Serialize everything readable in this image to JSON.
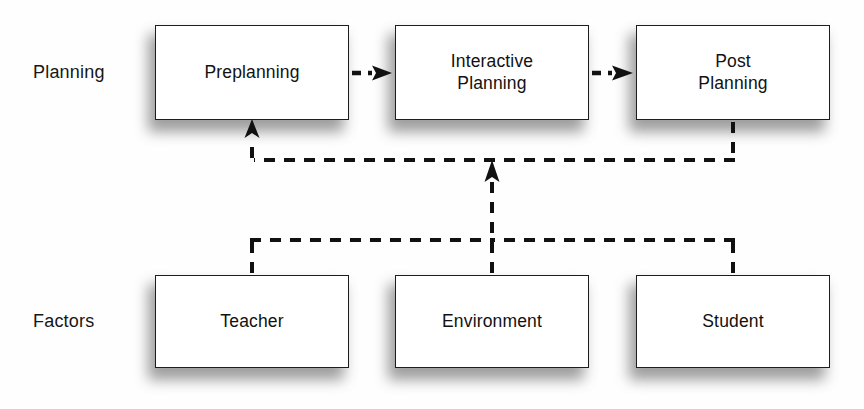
{
  "diagram": {
    "rows": [
      {
        "id": "planning",
        "label": "Planning"
      },
      {
        "id": "factors",
        "label": "Factors"
      }
    ],
    "nodes": [
      {
        "id": "preplanning",
        "label": "Preplanning",
        "row": "planning"
      },
      {
        "id": "interactive-planning",
        "label": "Interactive\nPlanning",
        "row": "planning"
      },
      {
        "id": "post-planning",
        "label": "Post\nPlanning",
        "row": "planning"
      },
      {
        "id": "teacher",
        "label": "Teacher",
        "row": "factors"
      },
      {
        "id": "environment",
        "label": "Environment",
        "row": "factors"
      },
      {
        "id": "student",
        "label": "Student",
        "row": "factors"
      }
    ],
    "connections": [
      {
        "id": "preplanning-to-interactive",
        "from": "preplanning",
        "to": "interactive-planning",
        "style": "dashed-arrow",
        "direction": "right"
      },
      {
        "id": "interactive-to-post",
        "from": "interactive-planning",
        "to": "post-planning",
        "style": "dashed-arrow",
        "direction": "right"
      },
      {
        "id": "post-to-preplanning-feedback",
        "from": "post-planning",
        "to": "preplanning",
        "style": "dashed-arrow",
        "direction": "up"
      },
      {
        "id": "teacher-to-feedback-line",
        "from": "teacher",
        "to": "interactive-planning",
        "style": "dashed",
        "direction": "up"
      },
      {
        "id": "environment-to-interactive",
        "from": "environment",
        "to": "interactive-planning",
        "style": "dashed-arrow",
        "direction": "up"
      },
      {
        "id": "student-to-feedback-line",
        "from": "student",
        "to": "interactive-planning",
        "style": "dashed",
        "direction": "up"
      }
    ],
    "colors": {
      "box_fill": "#ffffff",
      "box_border": "#1d1d1d",
      "line": "#111111",
      "text": "#111111",
      "shadow": "#8d8d8d",
      "background": "#ffffff"
    }
  }
}
